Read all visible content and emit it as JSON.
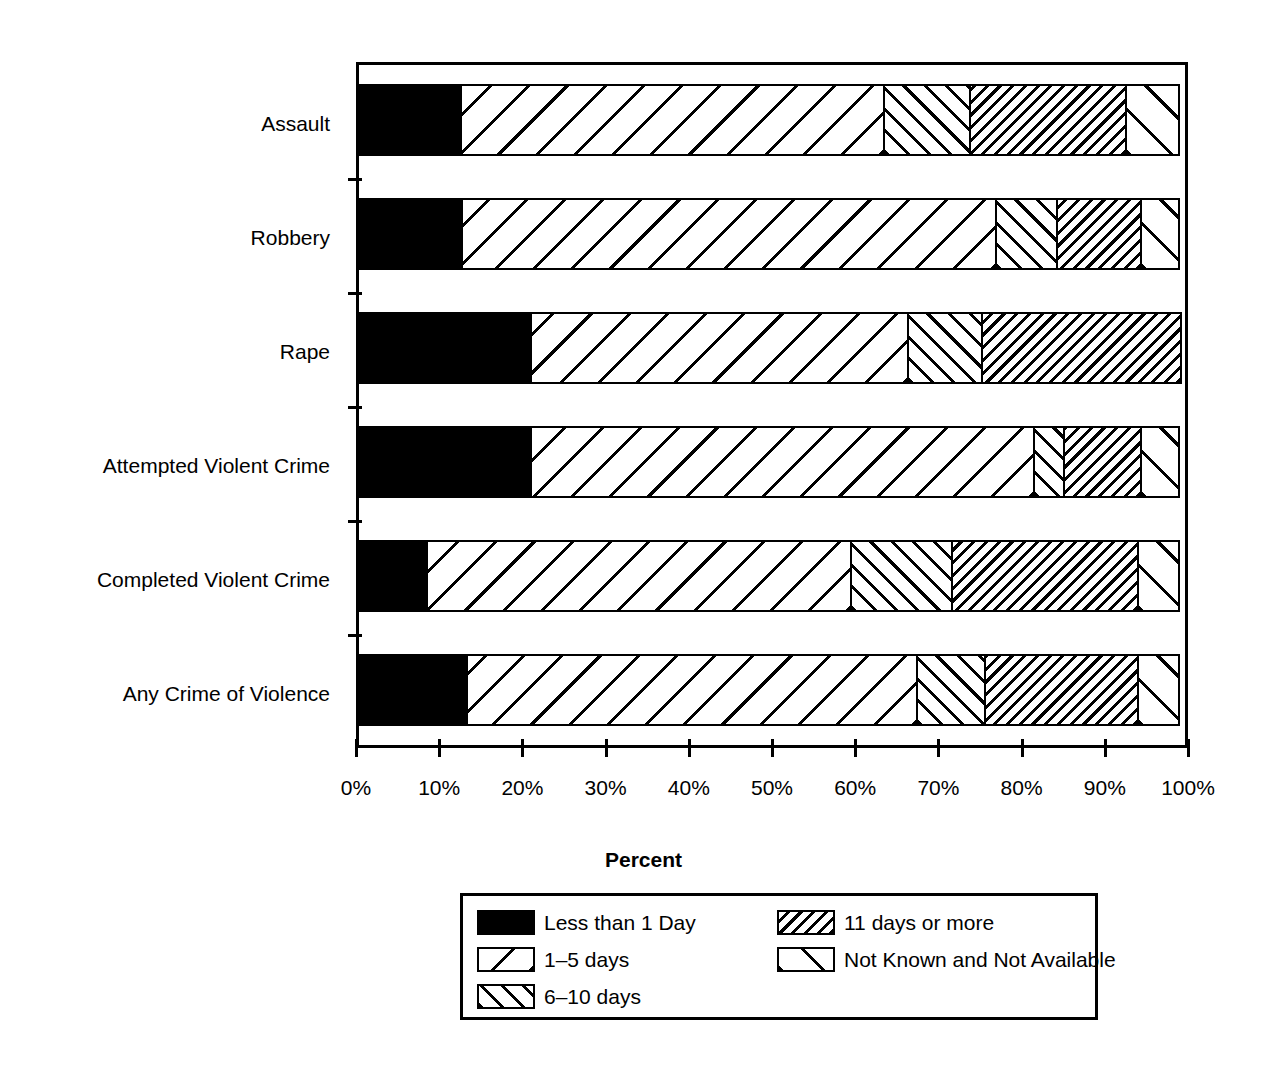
{
  "chart_data": {
    "type": "bar",
    "orientation": "horizontal",
    "stacked": true,
    "title": "",
    "xlabel": "Percent",
    "ylabel": "",
    "xlim": [
      0,
      100
    ],
    "xticks": [
      "0%",
      "10%",
      "20%",
      "30%",
      "40%",
      "50%",
      "60%",
      "70%",
      "80%",
      "90%",
      "100%"
    ],
    "xtick_values": [
      0,
      10,
      20,
      30,
      40,
      50,
      60,
      70,
      80,
      90,
      100
    ],
    "grid": false,
    "legend_position": "bottom",
    "categories": [
      "Assault",
      "Robbery",
      "Rape",
      "Attempted Violent Crime",
      "Completed Violent Crime",
      "Any Crime of Violence"
    ],
    "series": [
      {
        "name": "Less than 1 Day",
        "pattern": "solid-black",
        "values": [
          12.7,
          12.9,
          21.2,
          21.2,
          8.6,
          13.5
        ]
      },
      {
        "name": "1–5 days",
        "pattern": "diagonal-wide",
        "values": [
          51.1,
          64.4,
          45.5,
          60.7,
          51.3,
          54.3
        ]
      },
      {
        "name": "6–10 days",
        "pattern": "diagonal-medium",
        "values": [
          10.6,
          7.6,
          9.2,
          3.8,
          12.3,
          8.4
        ]
      },
      {
        "name": "11 days or more",
        "pattern": "diagonal-dense",
        "values": [
          19.0,
          10.3,
          24.1,
          9.5,
          22.6,
          18.6
        ]
      },
      {
        "name": "Not Known and Not Available",
        "pattern": "diagonal-sparse",
        "values": [
          6.6,
          4.8,
          0.0,
          4.8,
          5.2,
          5.2
        ]
      }
    ],
    "legend_entries": [
      {
        "label": "Less than 1 Day",
        "pattern": "solid-black"
      },
      {
        "label": "11 days or more",
        "pattern": "diagonal-dense"
      },
      {
        "label": "1–5 days",
        "pattern": "diagonal-wide"
      },
      {
        "label": "Not Known and Not Available",
        "pattern": "diagonal-sparse"
      },
      {
        "label": "6–10 days",
        "pattern": "diagonal-medium"
      }
    ]
  },
  "colors": {
    "foreground": "#000000",
    "background": "#ffffff"
  }
}
